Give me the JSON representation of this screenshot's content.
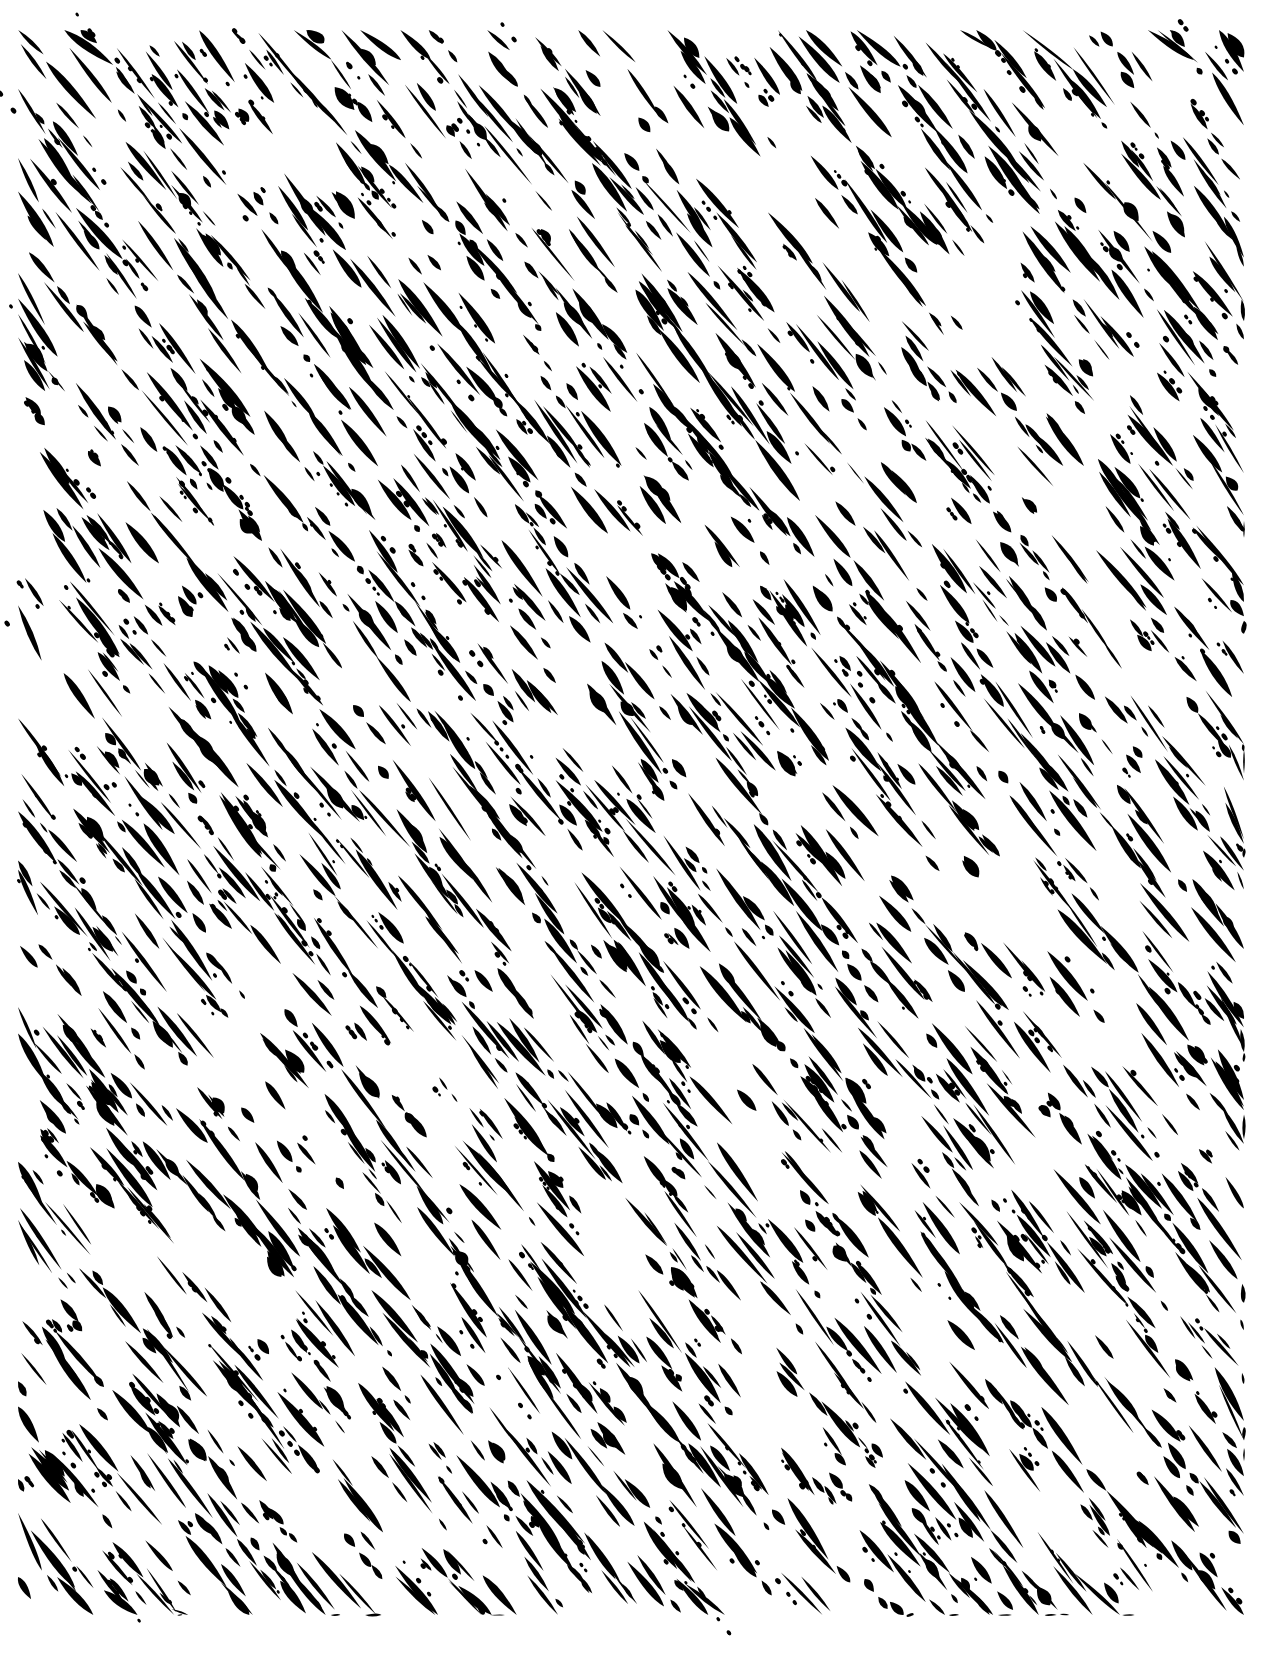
{
  "canvas": {
    "width": 1264,
    "height": 1657,
    "background": "#ffffff"
  },
  "texture": {
    "description": "black diagonal rain/brush stroke texture",
    "ink_color": "#000000",
    "region": {
      "x": 18,
      "y": 30,
      "width": 1226,
      "height": 1585
    },
    "angle_deg": 52,
    "seed": 1337,
    "grid": {
      "cols": 26,
      "rows": 34
    },
    "strokes_per_cell": 2,
    "stroke_length": {
      "min": 14,
      "max": 78
    },
    "stroke_width": {
      "min": 3,
      "max": 11
    },
    "dot_probability": 0.35,
    "dot_radius": {
      "min": 1.2,
      "max": 2.6
    },
    "blob_probability": 0.06,
    "empty_cell_probability": 0.12
  }
}
